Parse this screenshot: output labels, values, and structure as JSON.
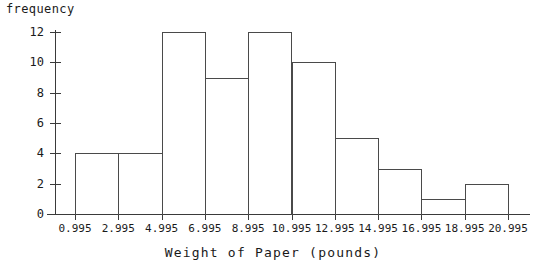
{
  "chart_data": {
    "type": "bar",
    "chart_subtype": "histogram",
    "title": "",
    "xlabel": "Weight of Paper (pounds)",
    "ylabel": "frequency",
    "bin_edges": [
      0.995,
      2.995,
      4.995,
      6.995,
      8.995,
      10.995,
      12.995,
      14.995,
      16.995,
      18.995,
      20.995
    ],
    "bin_width": 2,
    "categories": [
      "0.995-2.995",
      "2.995-4.995",
      "4.995-6.995",
      "6.995-8.995",
      "8.995-10.995",
      "10.995-12.995",
      "12.995-14.995",
      "14.995-16.995",
      "16.995-18.995",
      "18.995-20.995"
    ],
    "values": [
      4,
      4,
      12,
      9,
      12,
      10,
      5,
      3,
      1,
      2
    ],
    "total_count": 62,
    "xtick_labels": [
      "0.995",
      "2.995",
      "4.995",
      "6.995",
      "8.995",
      "10.995",
      "12.995",
      "14.995",
      "16.995",
      "18.995",
      "20.995"
    ],
    "ytick_labels": [
      "0",
      "2",
      "4",
      "6",
      "8",
      "10",
      "12"
    ],
    "ytick_values": [
      0,
      2,
      4,
      6,
      8,
      10,
      12
    ],
    "ylim": [
      0,
      12.6
    ],
    "xlim": [
      0.995,
      20.995
    ],
    "grid": false,
    "legend": false,
    "legend_position": "none",
    "bar_fill_color": "#ffffff",
    "bar_edge_color": "#4a4a4a",
    "axis_color": "#3a3a3a",
    "text_color": "#1a1a1a",
    "background_color": "#ffffff"
  }
}
